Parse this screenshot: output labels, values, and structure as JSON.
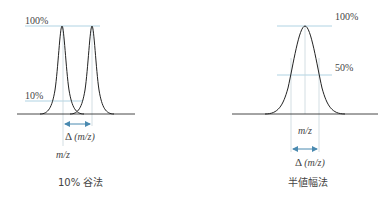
{
  "left_panel": {
    "label_100": "100%",
    "label_10": "10%",
    "delta_label_prefix": "Δ",
    "delta_label_var": "(m/z)",
    "mz_label": "m/z",
    "caption": "10% 谷法"
  },
  "right_panel": {
    "label_100": "100%",
    "label_50": "50%",
    "mz_label": "m/z",
    "delta_label_prefix": "Δ",
    "delta_label_var": "(m/z)",
    "caption": "半値幅法"
  },
  "colors": {
    "curve": "#222222",
    "guide_line": "#9cc8dc",
    "arrow": "#4a8ab0",
    "baseline": "#333333"
  }
}
